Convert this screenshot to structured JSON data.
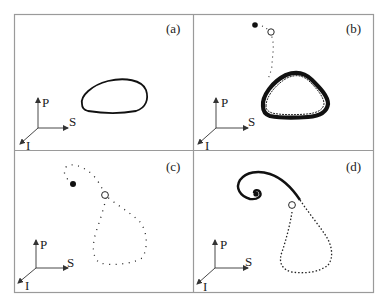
{
  "figure": {
    "type": "phase-portrait-grid",
    "layout": "2x2",
    "colors": {
      "frame": "#9a9a9a",
      "trajectory": "#111111",
      "background": "#ffffff"
    },
    "panels": [
      {
        "id": "a",
        "label": "(a)",
        "axes": {
          "vertical": "P",
          "horizontal": "S",
          "depth": "I"
        },
        "content": "closed limit cycle (thin solid loop)",
        "markers": []
      },
      {
        "id": "b",
        "label": "(b)",
        "axes": {
          "vertical": "P",
          "horizontal": "S",
          "depth": "I"
        },
        "content": "dotted trajectory from fixed points converging to thick noisy limit cycle",
        "markers": [
          {
            "type": "filled-circle",
            "meaning": "stable fixed point"
          },
          {
            "type": "open-circle",
            "meaning": "unstable fixed point"
          }
        ]
      },
      {
        "id": "c",
        "label": "(c)",
        "axes": {
          "vertical": "P",
          "horizontal": "S",
          "depth": "I"
        },
        "content": "sparse dotted homoclinic-like loop through open circle, ending near filled point",
        "markers": [
          {
            "type": "filled-circle",
            "meaning": "stable fixed point"
          },
          {
            "type": "open-circle",
            "meaning": "saddle point"
          }
        ]
      },
      {
        "id": "d",
        "label": "(d)",
        "axes": {
          "vertical": "P",
          "horizontal": "S",
          "depth": "I"
        },
        "content": "dense trajectory spiraling into filled fixed point after excursion loop",
        "markers": [
          {
            "type": "filled-circle",
            "meaning": "stable focus"
          },
          {
            "type": "open-circle",
            "meaning": "saddle point"
          }
        ]
      }
    ]
  }
}
